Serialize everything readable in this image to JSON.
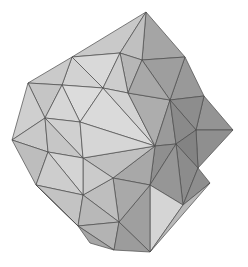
{
  "scene": {
    "title": "Polyhedron Wireframe Render",
    "object_name": "triangulated-polyhedron",
    "description": "Shaded triangulated convex polyhedron (geodesic / pentakis dodecahedron style) rendered in grayscale on a white background",
    "render_style": "flat-shaded-faceted",
    "background_color": "#ffffff",
    "edge_color": "#4a4a4a",
    "edge_width": 0.7,
    "light_direction": "upper-left",
    "width": 248,
    "height": 267,
    "silhouette_extremes": {
      "top_apex": [
        145,
        12
      ],
      "left_extreme": [
        12,
        140
      ],
      "right_extreme": [
        233,
        130
      ],
      "bottom_extreme": [
        150,
        252
      ]
    },
    "palette": {
      "lightest": "#e2e2e2",
      "light": "#d4d4d4",
      "mid_light": "#c2c2c2",
      "mid": "#aaaaaa",
      "mid_dark": "#989898",
      "dark": "#858585",
      "darkest": "#6f6f6f"
    },
    "faces": [
      {
        "name": "top-left-crown-a",
        "points": "72,57 146,12 120,53",
        "fill": "#c9c9c9"
      },
      {
        "name": "top-left-crown-b",
        "points": "72,57 120,53 103,88",
        "fill": "#d9d9d9"
      },
      {
        "name": "top-left-crown-c",
        "points": "72,57 103,88 62,85",
        "fill": "#d2d2d2"
      },
      {
        "name": "top-apex-right",
        "points": "146,12 185,57 142,60",
        "fill": "#a5a5a5"
      },
      {
        "name": "top-apex-mid",
        "points": "146,12 142,60 120,53",
        "fill": "#c0c0c0"
      },
      {
        "name": "top-mid-bridge",
        "points": "120,53 142,60 128,93",
        "fill": "#b6b6b6"
      },
      {
        "name": "top-mid-bridge-b",
        "points": "120,53 128,93 103,88",
        "fill": "#cdcdcd"
      },
      {
        "name": "upper-left-flank",
        "points": "72,57 62,85 28,83",
        "fill": "#cacaca"
      },
      {
        "name": "upper-left-flank-b",
        "points": "28,83 62,85 45,118",
        "fill": "#c5c5c5"
      },
      {
        "name": "left-flank-upper",
        "points": "28,83 45,118 12,140",
        "fill": "#cfcfcf"
      },
      {
        "name": "left-flank-lower",
        "points": "12,140 45,118 48,152",
        "fill": "#c9c9c9"
      },
      {
        "name": "left-flank-bottom",
        "points": "12,140 48,152 36,185",
        "fill": "#bdbdbd"
      },
      {
        "name": "left-inner-upper",
        "points": "62,85 103,88 80,122",
        "fill": "#dcdcdc"
      },
      {
        "name": "left-inner-mid",
        "points": "62,85 80,122 45,118",
        "fill": "#d6d6d6"
      },
      {
        "name": "left-inner-lower",
        "points": "45,118 80,122 83,158",
        "fill": "#d0d0d0"
      },
      {
        "name": "left-inner-bottom",
        "points": "45,118 83,158 48,152",
        "fill": "#c6c6c6"
      },
      {
        "name": "center-cap-upper-left",
        "points": "80,122 103,88 155,146",
        "fill": "#dadada"
      },
      {
        "name": "center-cap-upper-mid",
        "points": "103,88 128,93 155,146",
        "fill": "#d3d3d3"
      },
      {
        "name": "center-cap-upper-right",
        "points": "128,93 170,100 155,146",
        "fill": "#adadad"
      },
      {
        "name": "center-cap-right",
        "points": "170,100 176,144 155,146",
        "fill": "#9a9a9a"
      },
      {
        "name": "center-cap-lower-right",
        "points": "176,144 150,185 155,146",
        "fill": "#8f8f8f"
      },
      {
        "name": "center-cap-lower",
        "points": "150,185 113,178 155,146",
        "fill": "#a8a8a8"
      },
      {
        "name": "center-cap-lower-left",
        "points": "113,178 83,158 155,146",
        "fill": "#c0c0c0"
      },
      {
        "name": "center-cap-left",
        "points": "83,158 80,122 155,146",
        "fill": "#d6d6d6"
      },
      {
        "name": "upper-right-face-a",
        "points": "185,57 204,96 170,100",
        "fill": "#999999"
      },
      {
        "name": "upper-right-face-b",
        "points": "185,57 170,100 142,60",
        "fill": "#9e9e9e"
      },
      {
        "name": "upper-right-face-c",
        "points": "142,60 170,100 128,93",
        "fill": "#a8a8a8"
      },
      {
        "name": "right-flank-upper",
        "points": "204,96 233,130 196,130",
        "fill": "#949494"
      },
      {
        "name": "right-flank-mid",
        "points": "204,96 196,130 170,100",
        "fill": "#8d8d8d"
      },
      {
        "name": "right-inner-upper",
        "points": "170,100 196,130 176,144",
        "fill": "#8a8a8a"
      },
      {
        "name": "right-flank-lower",
        "points": "233,130 198,168 196,130",
        "fill": "#8f8f8f"
      },
      {
        "name": "right-inner-lower",
        "points": "196,130 198,168 176,144",
        "fill": "#838383"
      },
      {
        "name": "lower-right-flank",
        "points": "198,168 183,205 176,144",
        "fill": "#8c8c8c"
      },
      {
        "name": "lower-right-inner",
        "points": "176,144 183,205 150,185",
        "fill": "#969696"
      },
      {
        "name": "bottom-right-face-a",
        "points": "183,205 150,252 150,185",
        "fill": "#d5d5d5"
      },
      {
        "name": "bottom-right-face-b",
        "points": "150,185 150,252 119,222",
        "fill": "#9f9f9f"
      },
      {
        "name": "bottom-mid-face",
        "points": "150,185 119,222 113,178",
        "fill": "#a9a9a9"
      },
      {
        "name": "bottom-left-inner",
        "points": "113,178 119,222 83,195",
        "fill": "#bebebe"
      },
      {
        "name": "bottom-left-face",
        "points": "113,178 83,195 83,158",
        "fill": "#cbcbcb"
      },
      {
        "name": "lower-left-inner",
        "points": "83,158 83,195 48,152",
        "fill": "#d4d4d4"
      },
      {
        "name": "lower-left-flank",
        "points": "48,152 83,195 36,185",
        "fill": "#cdcdcd"
      },
      {
        "name": "bottom-left-flank",
        "points": "36,185 83,195 78,226",
        "fill": "#c3c3c3"
      },
      {
        "name": "bottom-left-corner",
        "points": "36,185 78,226 72,220",
        "fill": "#b0b0b0"
      },
      {
        "name": "bottom-face-left",
        "points": "78,226 83,195 119,222",
        "fill": "#b8b8b8"
      },
      {
        "name": "bottom-face-mid",
        "points": "78,226 119,222 114,250",
        "fill": "#b3b3b3"
      },
      {
        "name": "bottom-face-right",
        "points": "119,222 150,252 114,250",
        "fill": "#9c9c9c"
      },
      {
        "name": "bottom-edge-strip",
        "points": "78,226 114,250 90,243",
        "fill": "#a6a6a6"
      },
      {
        "name": "right-bottom-sliver",
        "points": "183,205 198,168 210,183",
        "fill": "#8e8e8e"
      },
      {
        "name": "right-bottom-sliver-b",
        "points": "183,205 210,183 150,252",
        "fill": "#b9b9b9"
      }
    ]
  }
}
